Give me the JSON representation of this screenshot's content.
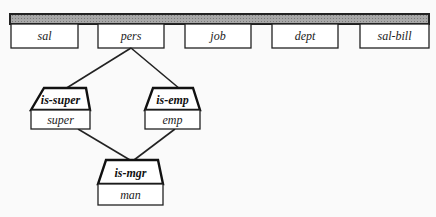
{
  "diagram": {
    "bar_fill": "#9a9a9a",
    "top_boxes": [
      {
        "label": "sal"
      },
      {
        "label": "pers"
      },
      {
        "label": "job"
      },
      {
        "label": "dept"
      },
      {
        "label": "sal-bill"
      }
    ],
    "nodes": {
      "super": {
        "header": "is-super",
        "label": "super"
      },
      "emp": {
        "header": "is-emp",
        "label": "emp"
      },
      "mgr": {
        "header": "is-mgr",
        "label": "man"
      }
    },
    "edges": [
      {
        "from": "pers",
        "to": "is-super"
      },
      {
        "from": "pers",
        "to": "is-emp"
      },
      {
        "from": "super",
        "to": "is-mgr"
      },
      {
        "from": "emp",
        "to": "is-mgr"
      }
    ]
  }
}
